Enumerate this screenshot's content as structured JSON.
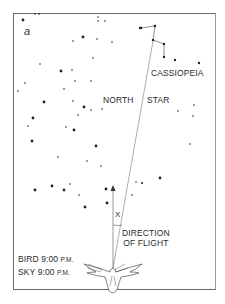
{
  "figure": {
    "panel_letter": "a",
    "labels": {
      "constellation": "CASSIOPEIA",
      "north": "NORTH",
      "star": "STAR",
      "angle": "X",
      "direction_line1": "DIRECTION",
      "direction_line2": "OF FLIGHT",
      "bird_label": "BIRD",
      "bird_time": "9:00",
      "bird_ampm": "P.M.",
      "sky_label": "SKY",
      "sky_time": "9:00",
      "sky_ampm": "P.M."
    },
    "icons": {
      "bird": "bird-icon",
      "arrow": "arrow-up-icon"
    },
    "colors": {
      "ink": "#2a2a2a",
      "frame": "#6a6a6a",
      "background": "#ffffff"
    }
  }
}
